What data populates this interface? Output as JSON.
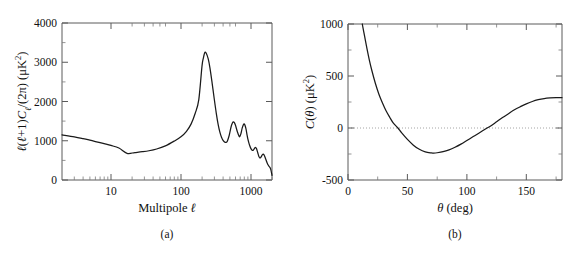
{
  "figure": {
    "background": "#ffffff",
    "curve_color": "#1a1a1a",
    "axis_color": "#5a5a5a",
    "zeroline_color": "#9a9a9a"
  },
  "panel_a": {
    "caption": "(a)",
    "xlabel": "Multipole ℓ",
    "ylabel": "ℓ(ℓ+1)Cℓ/(2π) (μK²)",
    "xticks": [
      "10",
      "100",
      "1000"
    ],
    "yticks": [
      "0",
      "1000",
      "2000",
      "3000",
      "4000"
    ]
  },
  "panel_b": {
    "caption": "(b)",
    "xlabel": "θ (deg)",
    "ylabel": "C(θ) (μK²)",
    "xticks": [
      "0",
      "50",
      "100",
      "150"
    ],
    "yticks": [
      "-500",
      "0",
      "500",
      "1000"
    ]
  },
  "chart_data": [
    {
      "type": "line",
      "title": "CMB temperature angular power spectrum",
      "panel": "(a)",
      "xlabel": "Multipole ℓ",
      "ylabel": "ℓ(ℓ+1)Cℓ/(2π) (μK²)",
      "xscale": "log",
      "yscale": "linear",
      "xlim": [
        2,
        2000
      ],
      "ylim": [
        0,
        4000
      ],
      "xticks": [
        10,
        100,
        1000
      ],
      "yticks": [
        0,
        1000,
        2000,
        3000,
        4000
      ],
      "grid": false,
      "legend": null,
      "annotations": [
        {
          "label": "first acoustic peak",
          "x": 220,
          "y": 3250
        },
        {
          "label": "Sachs-Wolfe plateau",
          "x": 2,
          "y": 1150
        },
        {
          "label": "plateau minimum",
          "x": 17,
          "y": 680
        }
      ],
      "x": [
        2,
        3,
        4,
        5,
        6,
        8,
        10,
        13,
        17,
        22,
        28,
        35,
        45,
        60,
        80,
        100,
        120,
        140,
        160,
        180,
        200,
        210,
        220,
        230,
        245,
        260,
        280,
        300,
        320,
        340,
        360,
        380,
        400,
        420,
        440,
        460,
        490,
        520,
        540,
        560,
        580,
        600,
        640,
        680,
        700,
        720,
        750,
        780,
        800,
        820,
        850,
        880,
        900,
        930,
        960,
        1000,
        1040,
        1080,
        1120,
        1160,
        1200,
        1250,
        1300,
        1350,
        1400,
        1450,
        1500,
        1560,
        1620,
        1700,
        1780,
        1850,
        1920,
        2000
      ],
      "y": [
        1150,
        1100,
        1055,
        1015,
        980,
        925,
        880,
        815,
        680,
        700,
        720,
        745,
        790,
        870,
        990,
        1100,
        1240,
        1430,
        1700,
        2050,
        2900,
        3120,
        3250,
        3230,
        3090,
        2850,
        2450,
        2050,
        1700,
        1420,
        1220,
        1090,
        1010,
        970,
        960,
        990,
        1140,
        1350,
        1440,
        1480,
        1460,
        1400,
        1230,
        1110,
        1120,
        1180,
        1320,
        1410,
        1430,
        1400,
        1300,
        1150,
        1060,
        960,
        880,
        800,
        760,
        760,
        800,
        830,
        800,
        700,
        600,
        560,
        590,
        640,
        660,
        620,
        540,
        440,
        370,
        330,
        270,
        120
      ]
    },
    {
      "type": "line",
      "title": "CMB two-point angular correlation function",
      "panel": "(b)",
      "xlabel": "θ (deg)",
      "ylabel": "C(θ) (μK²)",
      "xscale": "linear",
      "yscale": "linear",
      "xlim": [
        0,
        180
      ],
      "ylim": [
        -500,
        1000
      ],
      "xticks": [
        0,
        50,
        100,
        150
      ],
      "yticks": [
        -500,
        0,
        500,
        1000
      ],
      "grid": false,
      "legend": null,
      "zero_reference_line": 0,
      "annotations": [
        {
          "label": "first zero crossing",
          "x": 42,
          "y": 0
        },
        {
          "label": "minimum",
          "x": 72,
          "y": -240
        },
        {
          "label": "second zero crossing",
          "x": 117,
          "y": 0
        }
      ],
      "x": [
        12,
        14,
        16,
        18,
        20,
        23,
        26,
        29,
        32,
        35,
        38,
        42,
        45,
        50,
        55,
        60,
        65,
        70,
        72,
        75,
        80,
        85,
        90,
        95,
        100,
        105,
        110,
        117,
        120,
        125,
        130,
        135,
        140,
        145,
        150,
        155,
        160,
        165,
        170,
        175,
        180
      ],
      "y": [
        1000,
        880,
        760,
        650,
        555,
        430,
        325,
        240,
        165,
        105,
        50,
        0,
        -45,
        -110,
        -165,
        -205,
        -230,
        -240,
        -241,
        -238,
        -228,
        -210,
        -185,
        -155,
        -120,
        -85,
        -50,
        0,
        20,
        60,
        100,
        138,
        175,
        205,
        232,
        255,
        272,
        283,
        289,
        292,
        292
      ]
    }
  ]
}
